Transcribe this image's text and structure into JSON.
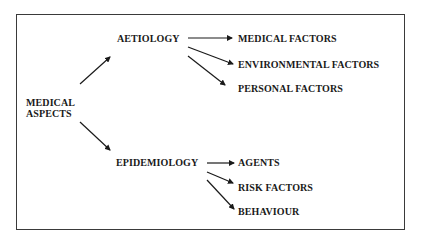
{
  "diagram": {
    "root": {
      "line1": "MEDICAL",
      "line2": "ASPECTS"
    },
    "branches": [
      {
        "label": "AETIOLOGY",
        "children": [
          "MEDICAL FACTORS",
          "ENVIRONMENTAL FACTORS",
          "PERSONAL FACTORS"
        ]
      },
      {
        "label": "EPIDEMIOLOGY",
        "children": [
          "AGENTS",
          "RISK FACTORS",
          "BEHAVIOUR"
        ]
      }
    ]
  }
}
